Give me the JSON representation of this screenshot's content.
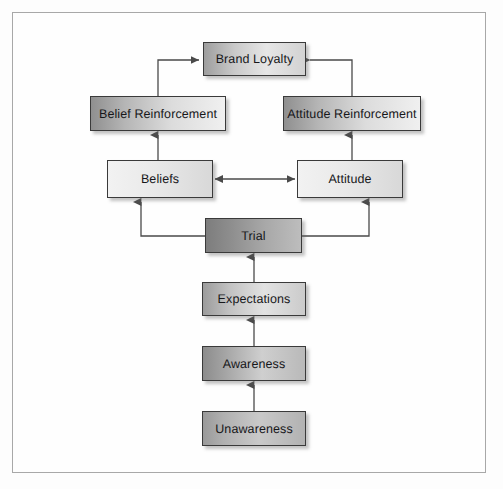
{
  "diagram": {
    "type": "flow-diagram",
    "background_color": "#fdfdfd",
    "frame_border_color": "#a8a8a8",
    "nodes": [
      {
        "id": "brand-loyalty",
        "label": "Brand Loyalty",
        "x": 203,
        "y": 42,
        "w": 103,
        "h": 34,
        "style": "grad-mid",
        "level": 1
      },
      {
        "id": "belief-reinforcement",
        "label": "Belief Reinforcement",
        "x": 90,
        "y": 96,
        "w": 136,
        "h": 35,
        "style": "grad-reinf",
        "level": 2
      },
      {
        "id": "attitude-reinforcement",
        "label": "Attitude Reinforcement",
        "x": 283,
        "y": 96,
        "w": 138,
        "h": 35,
        "style": "grad-reinf",
        "level": 2
      },
      {
        "id": "beliefs",
        "label": "Beliefs",
        "x": 107,
        "y": 160,
        "w": 106,
        "h": 38,
        "style": "grad-light",
        "level": 3
      },
      {
        "id": "attitude",
        "label": "Attitude",
        "x": 297,
        "y": 160,
        "w": 106,
        "h": 38,
        "style": "grad-light",
        "level": 3
      },
      {
        "id": "trial",
        "label": "Trial",
        "x": 205,
        "y": 218,
        "w": 97,
        "h": 35,
        "style": "grad-dark",
        "level": 4
      },
      {
        "id": "expectations",
        "label": "Expectations",
        "x": 202,
        "y": 282,
        "w": 104,
        "h": 34,
        "style": "grad-expect",
        "level": 5
      },
      {
        "id": "awareness",
        "label": "Awareness",
        "x": 202,
        "y": 346,
        "w": 104,
        "h": 35,
        "style": "grad-mid2",
        "level": 6
      },
      {
        "id": "unawareness",
        "label": "Unawareness",
        "x": 202,
        "y": 411,
        "w": 104,
        "h": 35,
        "style": "grad-unaware",
        "level": 7
      }
    ],
    "edges": [
      {
        "id": "edge-unawareness-awareness",
        "from": "unawareness",
        "to": "awareness",
        "kind": "vertical-up"
      },
      {
        "id": "edge-awareness-expectations",
        "from": "awareness",
        "to": "expectations",
        "kind": "vertical-up"
      },
      {
        "id": "edge-expectations-trial",
        "from": "expectations",
        "to": "trial",
        "kind": "vertical-up"
      },
      {
        "id": "edge-trial-beliefs",
        "from": "trial",
        "to": "beliefs",
        "kind": "elbow-left-up"
      },
      {
        "id": "edge-trial-attitude",
        "from": "trial",
        "to": "attitude",
        "kind": "elbow-right-up"
      },
      {
        "id": "edge-beliefs-attitude",
        "from": "beliefs",
        "to": "attitude",
        "kind": "horizontal-bidirectional"
      },
      {
        "id": "edge-beliefs-belief-reinforcement",
        "from": "beliefs",
        "to": "belief-reinforcement",
        "kind": "vertical-up"
      },
      {
        "id": "edge-attitude-attitude-reinforcement",
        "from": "attitude",
        "to": "attitude-reinforcement",
        "kind": "vertical-up"
      },
      {
        "id": "edge-belief-reinforcement-brand-loyalty",
        "from": "belief-reinforcement",
        "to": "brand-loyalty",
        "kind": "elbow-up-right"
      },
      {
        "id": "edge-attitude-reinforcement-brand-loyalty",
        "from": "attitude-reinforcement",
        "to": "brand-loyalty",
        "kind": "elbow-up-left"
      }
    ],
    "connector_color": "#4a4a4a"
  }
}
